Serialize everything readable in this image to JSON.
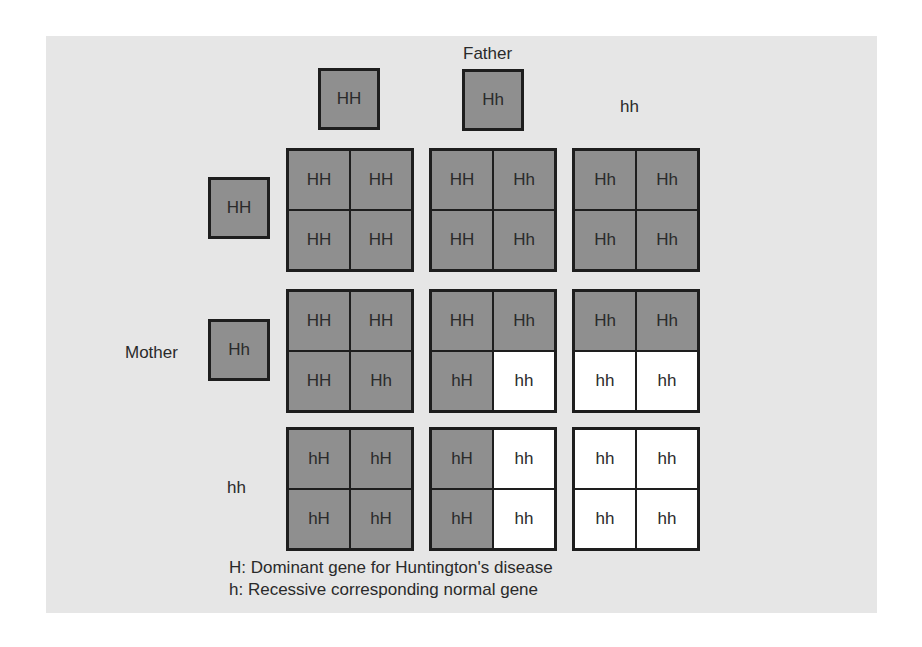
{
  "labels": {
    "father": "Father",
    "mother": "Mother"
  },
  "colors": {
    "affected_fill": "#8f8f8f",
    "normal_fill": "#ffffff",
    "border": "#1e1e1e",
    "background": "#e6e6e6"
  },
  "father_genotypes": [
    {
      "text": "HH",
      "boxed": true
    },
    {
      "text": "Hh",
      "boxed": true
    },
    {
      "text": "hh",
      "boxed": false
    }
  ],
  "mother_genotypes": [
    {
      "text": "HH",
      "boxed": true
    },
    {
      "text": "Hh",
      "boxed": true
    },
    {
      "text": "hh",
      "boxed": false
    }
  ],
  "punnett": [
    [
      {
        "cells": [
          {
            "t": "HH",
            "a": true
          },
          {
            "t": "HH",
            "a": true
          },
          {
            "t": "HH",
            "a": true
          },
          {
            "t": "HH",
            "a": true
          }
        ]
      },
      {
        "cells": [
          {
            "t": "HH",
            "a": true
          },
          {
            "t": "Hh",
            "a": true
          },
          {
            "t": "HH",
            "a": true
          },
          {
            "t": "Hh",
            "a": true
          }
        ]
      },
      {
        "cells": [
          {
            "t": "Hh",
            "a": true
          },
          {
            "t": "Hh",
            "a": true
          },
          {
            "t": "Hh",
            "a": true
          },
          {
            "t": "Hh",
            "a": true
          }
        ]
      }
    ],
    [
      {
        "cells": [
          {
            "t": "HH",
            "a": true
          },
          {
            "t": "HH",
            "a": true
          },
          {
            "t": "HH",
            "a": true
          },
          {
            "t": "Hh",
            "a": true
          }
        ]
      },
      {
        "cells": [
          {
            "t": "HH",
            "a": true
          },
          {
            "t": "Hh",
            "a": true
          },
          {
            "t": "hH",
            "a": true
          },
          {
            "t": "hh",
            "a": false
          }
        ]
      },
      {
        "cells": [
          {
            "t": "Hh",
            "a": true
          },
          {
            "t": "Hh",
            "a": true
          },
          {
            "t": "hh",
            "a": false
          },
          {
            "t": "hh",
            "a": false
          }
        ]
      }
    ],
    [
      {
        "cells": [
          {
            "t": "hH",
            "a": true
          },
          {
            "t": "hH",
            "a": true
          },
          {
            "t": "hH",
            "a": true
          },
          {
            "t": "hH",
            "a": true
          }
        ]
      },
      {
        "cells": [
          {
            "t": "hH",
            "a": true
          },
          {
            "t": "hh",
            "a": false
          },
          {
            "t": "hH",
            "a": true
          },
          {
            "t": "hh",
            "a": false
          }
        ]
      },
      {
        "cells": [
          {
            "t": "hh",
            "a": false
          },
          {
            "t": "hh",
            "a": false
          },
          {
            "t": "hh",
            "a": false
          },
          {
            "t": "hh",
            "a": false
          }
        ]
      }
    ]
  ],
  "legend": {
    "line1": "H:  Dominant gene for Huntington's disease",
    "line2": "h:  Recessive corresponding normal gene"
  }
}
